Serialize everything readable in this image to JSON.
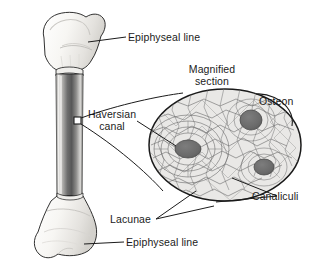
{
  "figure": {
    "background_color": "#ffffff",
    "width": 318,
    "height": 277
  },
  "labels": {
    "epiphyseal_line_top": "Epiphyseal line",
    "epiphyseal_line_bottom": "Epiphyseal line",
    "magnified_section_line1": "Magnified",
    "magnified_section_line2": "section",
    "haversian_canal_line1": "Haversian",
    "haversian_canal_line2": "canal",
    "osteon": "Osteon",
    "lacunae": "Lacunae",
    "canaliculi": "Canaliculi"
  },
  "colors": {
    "outline": "#1b1b1b",
    "bone_fill": "#f7f6f4",
    "bone_shade": "#d9d7d3",
    "shaft_light": "#f2f1ef",
    "shaft_dark": "#5d5d5d",
    "matrix_fill": "#e8e7e5",
    "matrix_line": "#6f6f6f",
    "osteon_fill": "#6a6a6a",
    "text": "#1b1b1b"
  },
  "structures": {
    "bone": {
      "name": "long-bone",
      "parts": [
        "proximal epiphysis",
        "diaphysis shaft",
        "distal epiphysis"
      ]
    },
    "magnified_circle": {
      "name": "magnified-osteon-section",
      "center_x": 225,
      "center_y": 145,
      "radius_x": 76,
      "radius_y": 56
    },
    "osteons": [
      {
        "name": "haversian-canal-center",
        "cx": 188,
        "cy": 149,
        "rx": 13,
        "ry": 9
      },
      {
        "name": "osteon-upper-right",
        "cx": 251,
        "cy": 120,
        "rx": 11,
        "ry": 10
      },
      {
        "name": "osteon-lower-right",
        "cx": 264,
        "cy": 167,
        "rx": 10,
        "ry": 8
      }
    ]
  }
}
